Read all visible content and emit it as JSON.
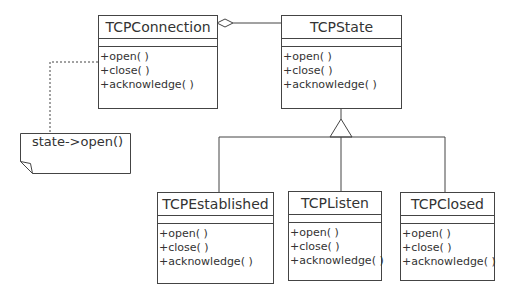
{
  "diagram": {
    "type": "uml-class-diagram",
    "classes": [
      {
        "id": "tcpconnection",
        "name": "TCPConnection",
        "operations": [
          "+open( )",
          "+close( )",
          "+acknowledge( )"
        ]
      },
      {
        "id": "tcpstate",
        "name": "TCPState",
        "operations": [
          "+open( )",
          "+close( )",
          "+acknowledge( )"
        ]
      },
      {
        "id": "tcpestablished",
        "name": "TCPEstablished",
        "operations": [
          "+open( )",
          "+close( )",
          "+acknowledge( )"
        ]
      },
      {
        "id": "tcplisten",
        "name": "TCPListen",
        "operations": [
          "+open( )",
          "+close( )",
          "+acknowledge( )"
        ]
      },
      {
        "id": "tcpclosed",
        "name": "TCPClosed",
        "operations": [
          "+open( )",
          "+close( )",
          "+acknowledge( )"
        ]
      }
    ],
    "note": {
      "text": "state->open()",
      "attached_to": "tcpconnection.open"
    },
    "relationships": [
      {
        "type": "aggregation",
        "from": "TCPConnection",
        "to": "TCPState"
      },
      {
        "type": "generalization",
        "from": "TCPEstablished",
        "to": "TCPState"
      },
      {
        "type": "generalization",
        "from": "TCPListen",
        "to": "TCPState"
      },
      {
        "type": "generalization",
        "from": "TCPClosed",
        "to": "TCPState"
      }
    ],
    "colors": {
      "line": "#444444",
      "text": "#333333",
      "background": "#ffffff"
    }
  }
}
